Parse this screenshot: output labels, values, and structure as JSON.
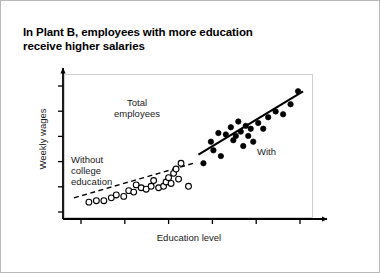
{
  "figure": {
    "title_lines": [
      "In Plant B, employees with more education",
      "receive higher salaries"
    ],
    "border_color": "#b9b9b9",
    "background": "#ffffff"
  },
  "chart_data": {
    "type": "scatter",
    "title": "In Plant B, employees with more education receive higher salaries",
    "xlabel": "Education level",
    "ylabel": "Weekly wages",
    "xlim": [
      0,
      100
    ],
    "ylim": [
      0,
      100
    ],
    "grid": false,
    "axis_style": "arrow",
    "x_tick_count": 6,
    "y_tick_count": 6,
    "x_tick_labels": [],
    "y_tick_labels": [],
    "legend_position": "inline-annotations",
    "annotations": [
      {
        "id": "total-employees",
        "text": "Total\nemployees",
        "x": 28,
        "y": 82
      },
      {
        "id": "without-college",
        "text": "Without\ncollege\neducation",
        "x": 6,
        "y": 48
      },
      {
        "id": "with-college",
        "text": "With",
        "x": 80,
        "y": 52
      }
    ],
    "series": [
      {
        "name": "Without college education",
        "marker": "open-circle",
        "marker_color": "#ffffff",
        "marker_edge_color": "#000000",
        "trendline": "dashed",
        "trendline_color": "#000000",
        "trendline_x": [
          4,
          52
        ],
        "trendline_y": [
          14,
          38
        ],
        "points": [
          {
            "x": 10,
            "y": 11
          },
          {
            "x": 13,
            "y": 12
          },
          {
            "x": 16,
            "y": 12
          },
          {
            "x": 19,
            "y": 14
          },
          {
            "x": 21,
            "y": 16
          },
          {
            "x": 24,
            "y": 15
          },
          {
            "x": 26,
            "y": 19
          },
          {
            "x": 28,
            "y": 18
          },
          {
            "x": 29,
            "y": 23
          },
          {
            "x": 31,
            "y": 21
          },
          {
            "x": 33,
            "y": 20
          },
          {
            "x": 35,
            "y": 22
          },
          {
            "x": 36,
            "y": 26
          },
          {
            "x": 38,
            "y": 21
          },
          {
            "x": 40,
            "y": 22
          },
          {
            "x": 41,
            "y": 25
          },
          {
            "x": 42,
            "y": 28
          },
          {
            "x": 43,
            "y": 24
          },
          {
            "x": 44,
            "y": 31
          },
          {
            "x": 45,
            "y": 34
          },
          {
            "x": 46,
            "y": 27
          },
          {
            "x": 47,
            "y": 38
          },
          {
            "x": 50,
            "y": 22
          }
        ]
      },
      {
        "name": "With college education",
        "marker": "filled-circle",
        "marker_color": "#000000",
        "marker_edge_color": "#000000",
        "trendline": "solid",
        "trendline_color": "#000000",
        "trendline_x": [
          54,
          96
        ],
        "trendline_y": [
          44,
          88
        ],
        "points": [
          {
            "x": 56,
            "y": 38
          },
          {
            "x": 59,
            "y": 53
          },
          {
            "x": 60,
            "y": 47
          },
          {
            "x": 62,
            "y": 59
          },
          {
            "x": 63,
            "y": 43
          },
          {
            "x": 65,
            "y": 58
          },
          {
            "x": 67,
            "y": 63
          },
          {
            "x": 68,
            "y": 54
          },
          {
            "x": 69,
            "y": 57
          },
          {
            "x": 70,
            "y": 67
          },
          {
            "x": 71,
            "y": 60
          },
          {
            "x": 72,
            "y": 50
          },
          {
            "x": 73,
            "y": 64
          },
          {
            "x": 74,
            "y": 57
          },
          {
            "x": 75,
            "y": 62
          },
          {
            "x": 76,
            "y": 53
          },
          {
            "x": 78,
            "y": 66
          },
          {
            "x": 80,
            "y": 62
          },
          {
            "x": 82,
            "y": 70
          },
          {
            "x": 85,
            "y": 74
          },
          {
            "x": 88,
            "y": 72
          },
          {
            "x": 91,
            "y": 79
          },
          {
            "x": 94,
            "y": 88
          }
        ]
      }
    ]
  }
}
